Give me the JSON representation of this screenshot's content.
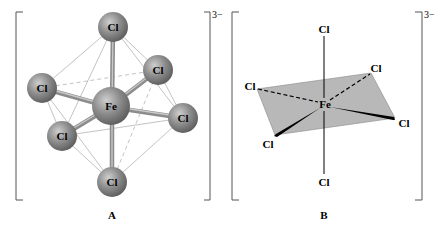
{
  "figure": {
    "panels": [
      {
        "id": "A",
        "caption": "A",
        "charge": "3−",
        "center_atom": "Fe",
        "ligands": [
          "Cl",
          "Cl",
          "Cl",
          "Cl",
          "Cl",
          "Cl"
        ]
      },
      {
        "id": "B",
        "caption": "B",
        "charge": "3−",
        "center_atom": "Fe",
        "ligands": [
          "Cl",
          "Cl",
          "Cl",
          "Cl",
          "Cl",
          "Cl"
        ]
      }
    ]
  },
  "colors": {
    "atom_fill": "#8a8a8a",
    "atom_highlight": "#c8c8c8",
    "bond": "#9a9a9a",
    "plane_fill": "#b8b8b8",
    "line": "#000000",
    "bracket": "#555555"
  }
}
